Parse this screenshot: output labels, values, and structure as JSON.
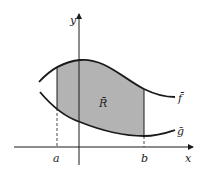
{
  "figure": {
    "axes": {
      "x_label": "x",
      "y_label": "y"
    },
    "region_label": "R̄",
    "curves": {
      "upper": "f̄",
      "lower": "ḡ"
    },
    "bounds": {
      "left": "a",
      "right": "b"
    },
    "colors": {
      "region_fill": "#b3b3b3",
      "stroke": "#1a1a1a"
    }
  }
}
